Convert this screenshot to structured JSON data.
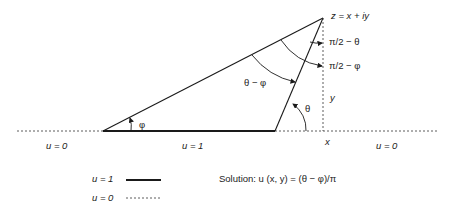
{
  "labels": {
    "apex": "z = x + iy",
    "pi2_theta": "π/2 − θ",
    "pi2_phi": "π/2 − φ",
    "theta_minus_phi": "θ − φ",
    "theta": "θ",
    "phi": "φ",
    "y": "y",
    "x": "x",
    "u0_left": "u = 0",
    "u1_mid": "u = 1",
    "u0_right": "u = 0"
  },
  "legend": {
    "solid_label": "u = 1",
    "dashed_label": "u = 0"
  },
  "solution": "Solution: u (x, y) = (θ − φ)/π",
  "colors": {
    "line": "#1a1a1a",
    "text": "#222222"
  }
}
